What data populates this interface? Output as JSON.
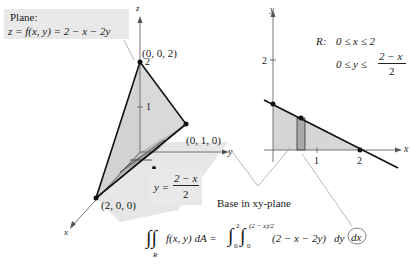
{
  "plane_label": {
    "title": "Plane:",
    "equation": "z = f(x, y) = 2 − x − 2y"
  },
  "figure3d": {
    "axes": {
      "x": "x",
      "y": "y",
      "z": "z"
    },
    "points": {
      "top": "(0, 0, 2)",
      "y_intercept": "(0, 1, 0)",
      "x_intercept": "(2, 0, 0)"
    },
    "z_ticks": [
      "2",
      "1"
    ],
    "boundary_label": {
      "lhs": "y =",
      "numerator": "2 − x",
      "denominator": "2"
    }
  },
  "figure2d": {
    "axes": {
      "x": "x",
      "y": "y"
    },
    "x_ticks": [
      "1",
      "2"
    ],
    "y_ticks": [
      "2"
    ],
    "region": {
      "name": "R:",
      "line1": "0 ≤ x ≤ 2",
      "line2_lhs": "0 ≤ y ≤",
      "line2_num": "2 − x",
      "line2_den": "2"
    }
  },
  "caption": "Base in xy-plane",
  "integral": {
    "lhs": "f(x, y) dA =",
    "region_sub": "R",
    "outer_upper": "2",
    "outer_lower": "0",
    "inner_upper": "(2 − x)/2",
    "inner_lower": "0",
    "integrand": "(2 − x − 2y)",
    "dy": "dy",
    "dx": "dx"
  },
  "colors": {
    "shade_light": "#e2e2e2",
    "shade_mid": "#cfcfcf",
    "shade_dark": "#a9a9a9",
    "line": "#111111",
    "axis": "#555555"
  }
}
